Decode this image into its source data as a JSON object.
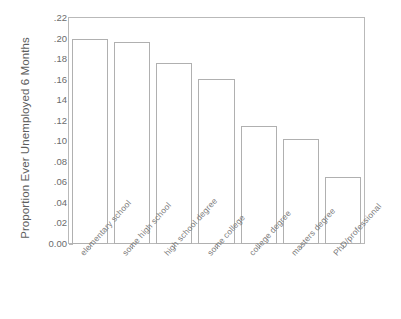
{
  "chart_data": {
    "type": "bar",
    "title": "",
    "xlabel": "",
    "ylabel": "Proportion Ever Unemployed 6 Months",
    "categories": [
      "elementary school",
      "some high school",
      "high school degree",
      "some college",
      "college degree",
      "masters degree",
      "PhD/professional"
    ],
    "values": [
      0.2,
      0.197,
      0.176,
      0.161,
      0.115,
      0.102,
      0.065
    ],
    "ylim": [
      0.0,
      0.22
    ],
    "ytick_labels": [
      "0.00",
      ".02",
      ".04",
      ".06",
      ".08",
      ".10",
      ".12",
      "14",
      ".16",
      ".18",
      ".20",
      ".22"
    ],
    "ytick_values": [
      0.0,
      0.02,
      0.04,
      0.06,
      0.08,
      0.1,
      0.12,
      0.14,
      0.16,
      0.18,
      0.2,
      0.22
    ],
    "grid": false,
    "legend": null,
    "bar_fill_color": "#ffffff",
    "bar_edge_color": "#b0b0b0",
    "axis_color": "#b9b9b9",
    "text_color": "#6f6f6f"
  }
}
